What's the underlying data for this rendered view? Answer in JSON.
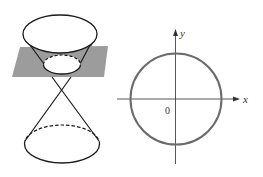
{
  "figure": {
    "colors": {
      "background": "#ffffff",
      "plane_fill": "#9c9c9c",
      "cone_stroke": "#1a1a1a",
      "circle_stroke": "#6b6b6b",
      "axis_stroke": "#444444"
    }
  },
  "cone_panel": {
    "upper_rim": {
      "cx": 60,
      "cy": 34,
      "rx": 37,
      "ry": 19
    },
    "cut_section": {
      "cx": 62,
      "cy": 64,
      "rx": 18.5,
      "ry": 9.5,
      "style": "front solid, back dashed"
    },
    "vertex": {
      "x": 62,
      "y": 89
    },
    "plane": {
      "points": "20,47 108,46 104,77 12,77"
    },
    "lower_rim": {
      "cx": 62,
      "cy": 144,
      "rx": 37.5,
      "ry": 19,
      "style": "front solid, back dashed"
    }
  },
  "axes_panel": {
    "origin_label": "0",
    "x_label": "x",
    "y_label": "y",
    "origin": {
      "x": 175.5,
      "y": 99
    },
    "circle_radius": 45.5
  }
}
